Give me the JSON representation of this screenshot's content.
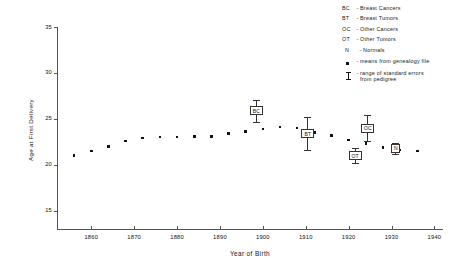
{
  "chart_data": {
    "type": "scatter",
    "title": "",
    "xlabel": "Year of Birth",
    "ylabel": "Age at First Delivery",
    "xlim": [
      1852,
      1942
    ],
    "ylim": [
      13,
      35
    ],
    "xticks": [
      1860,
      1870,
      1880,
      1890,
      1900,
      1910,
      1920,
      1930,
      1940
    ],
    "yticks": [
      15,
      20,
      25,
      30,
      35
    ],
    "grid": false,
    "legend_position": "top-right",
    "series": [
      {
        "name": "means from genealogy file",
        "marker": "square-dot",
        "x": [
          1856,
          1860,
          1864,
          1868,
          1872,
          1876,
          1880,
          1884,
          1888,
          1892,
          1896,
          1900,
          1904,
          1908,
          1912,
          1916,
          1920,
          1924,
          1928,
          1932,
          1936
        ],
        "y": [
          21.0,
          21.5,
          22.0,
          22.6,
          22.9,
          23.0,
          23.0,
          23.1,
          23.1,
          23.4,
          23.6,
          23.9,
          24.1,
          24.0,
          23.5,
          23.2,
          22.7,
          22.3,
          21.9,
          21.6,
          21.5
        ]
      }
    ],
    "groups": [
      {
        "code": "BC",
        "label": "Breast Cancers",
        "x": 1898.5,
        "y": 25.9,
        "err_low": 24.7,
        "err_high": 27.1
      },
      {
        "code": "BT",
        "label": "Breast Tumors",
        "x": 1910.5,
        "y": 23.4,
        "err_low": 21.6,
        "err_high": 25.2
      },
      {
        "code": "OC",
        "label": "Other Cancers",
        "x": 1924.5,
        "y": 24.0,
        "err_low": 22.6,
        "err_high": 25.4
      },
      {
        "code": "OT",
        "label": "Other Tumors",
        "x": 1921.5,
        "y": 21.0,
        "err_low": 20.2,
        "err_high": 21.8
      },
      {
        "code": "N",
        "label": "Normals",
        "x": 1931.0,
        "y": 21.8,
        "err_low": 21.2,
        "err_high": 22.4
      }
    ]
  },
  "legend": {
    "dash": "-",
    "entries": [
      {
        "key": "BC",
        "text": "Breast Cancers"
      },
      {
        "key": "BT",
        "text": "Breast Tumors"
      },
      {
        "key": "OC",
        "text": "Other Cancers"
      },
      {
        "key": "OT",
        "text": "Other Tumors"
      },
      {
        "key": "N",
        "text": "Normals"
      }
    ],
    "symbol_entries": [
      {
        "icon": "filled-square-marker",
        "text": "means from genealogy file"
      },
      {
        "icon": "error-bar-marker",
        "text": "range of standard errors\nfrom pedigree"
      }
    ]
  }
}
